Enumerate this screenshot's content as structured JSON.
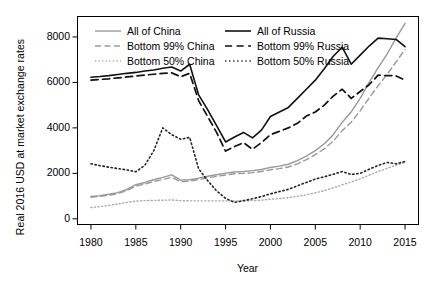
{
  "chart_data": {
    "type": "line",
    "title": "",
    "xlabel": "Year",
    "ylabel": "Real 2016 USD at market exchange rates",
    "xlim": [
      1978.5,
      2016.5
    ],
    "ylim": [
      -250,
      8900
    ],
    "grid": false,
    "legend_position": "top-left (inside panel, two columns)",
    "xticks": [
      "1980",
      "1985",
      "1990",
      "1995",
      "2000",
      "2005",
      "2010",
      "2015"
    ],
    "xtick_values": [
      1980,
      1985,
      1990,
      1995,
      2000,
      2005,
      2010,
      2015
    ],
    "yticks": [
      "0",
      "2000",
      "4000",
      "6000",
      "8000"
    ],
    "ytick_values": [
      0,
      2000,
      4000,
      6000,
      8000
    ],
    "x": [
      1980,
      1981,
      1982,
      1983,
      1984,
      1985,
      1986,
      1987,
      1988,
      1989,
      1990,
      1991,
      1992,
      1993,
      1994,
      1995,
      1996,
      1997,
      1998,
      1999,
      2000,
      2001,
      2002,
      2003,
      2004,
      2005,
      2006,
      2007,
      2008,
      2009,
      2010,
      2011,
      2012,
      2013,
      2014,
      2015
    ],
    "series": [
      {
        "name": "All of China",
        "style": "solid",
        "color": "#999999",
        "width": 1.4,
        "values": [
          980,
          1020,
          1080,
          1150,
          1290,
          1500,
          1600,
          1720,
          1820,
          1930,
          1700,
          1720,
          1790,
          1870,
          1940,
          2010,
          2060,
          2080,
          2120,
          2170,
          2260,
          2320,
          2400,
          2560,
          2760,
          3000,
          3300,
          3700,
          4250,
          4700,
          5300,
          6000,
          6650,
          7250,
          7950,
          8600
        ]
      },
      {
        "name": "Bottom 99% China",
        "style": "dashed",
        "color": "#999999",
        "width": 1.4,
        "values": [
          950,
          990,
          1040,
          1110,
          1240,
          1440,
          1530,
          1640,
          1730,
          1830,
          1630,
          1660,
          1730,
          1800,
          1870,
          1930,
          1980,
          2000,
          2030,
          2080,
          2160,
          2210,
          2280,
          2420,
          2600,
          2820,
          3080,
          3420,
          3880,
          4250,
          4750,
          5320,
          5850,
          6350,
          6900,
          7450
        ]
      },
      {
        "name": "Bottom 50% China",
        "style": "dotted",
        "color": "#aaaaaa",
        "width": 1.4,
        "values": [
          500,
          540,
          590,
          650,
          720,
          780,
          800,
          810,
          820,
          830,
          800,
          790,
          790,
          790,
          790,
          790,
          790,
          790,
          800,
          820,
          860,
          890,
          930,
          990,
          1060,
          1140,
          1240,
          1360,
          1500,
          1620,
          1760,
          1920,
          2080,
          2220,
          2360,
          2480
        ]
      },
      {
        "name": "All of Russia",
        "style": "solid",
        "color": "#111111",
        "width": 1.6,
        "values": [
          6230,
          6260,
          6300,
          6350,
          6400,
          6440,
          6500,
          6550,
          6620,
          6680,
          6500,
          6800,
          5450,
          4800,
          4100,
          3380,
          3600,
          3800,
          3560,
          3900,
          4500,
          4700,
          4900,
          5300,
          5700,
          6100,
          6600,
          7150,
          7550,
          6800,
          7200,
          7600,
          7950,
          7920,
          7890,
          7570
        ]
      },
      {
        "name": "Bottom 99% Russia",
        "style": "dashed",
        "color": "#111111",
        "width": 1.7,
        "values": [
          6100,
          6130,
          6160,
          6200,
          6240,
          6280,
          6320,
          6360,
          6400,
          6420,
          6250,
          6400,
          5200,
          4500,
          3800,
          2980,
          3180,
          3350,
          3060,
          3350,
          3700,
          3850,
          4000,
          4200,
          4520,
          4700,
          5000,
          5400,
          5700,
          5300,
          5600,
          5900,
          6320,
          6300,
          6290,
          6100
        ]
      },
      {
        "name": "Bottom 50% Russia",
        "style": "dotted",
        "color": "#222222",
        "width": 1.6,
        "values": [
          2420,
          2340,
          2270,
          2210,
          2150,
          2070,
          2350,
          3000,
          4000,
          3700,
          3500,
          3580,
          2200,
          1680,
          1230,
          900,
          720,
          800,
          880,
          980,
          1100,
          1200,
          1300,
          1450,
          1600,
          1750,
          1850,
          1960,
          2080,
          1950,
          2000,
          2180,
          2350,
          2480,
          2420,
          2520
        ]
      }
    ],
    "legend": [
      {
        "label": "All of China",
        "style": "solid",
        "color": "#999999",
        "column": 1,
        "row": 1
      },
      {
        "label": "Bottom 99% China",
        "style": "dashed",
        "color": "#999999",
        "column": 1,
        "row": 2
      },
      {
        "label": "Bottom 50% China",
        "style": "dotted",
        "color": "#aaaaaa",
        "column": 1,
        "row": 3
      },
      {
        "label": "All of Russia",
        "style": "solid",
        "color": "#111111",
        "column": 2,
        "row": 1
      },
      {
        "label": "Bottom 99% Russia",
        "style": "dashed",
        "color": "#111111",
        "column": 2,
        "row": 2
      },
      {
        "label": "Bottom 50% Russia",
        "style": "dotted",
        "color": "#222222",
        "column": 2,
        "row": 3
      }
    ]
  }
}
